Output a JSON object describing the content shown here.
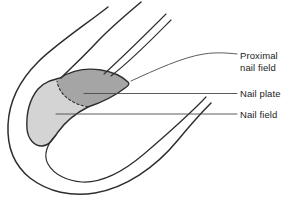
{
  "diagram": {
    "labels": {
      "proximal_nail_field_line1": "Proximal",
      "proximal_nail_field_line2": "nail field",
      "nail_plate": "Nail plate",
      "nail_field": "Nail field"
    },
    "colors": {
      "background": "#ffffff",
      "outline": "#2d2d2d",
      "proximal_nail_field_fill": "#a5a5a5",
      "nail_field_fill": "#d4d4d4",
      "leader_line": "#4a4a4a",
      "label_text": "#1c1c1c"
    }
  }
}
